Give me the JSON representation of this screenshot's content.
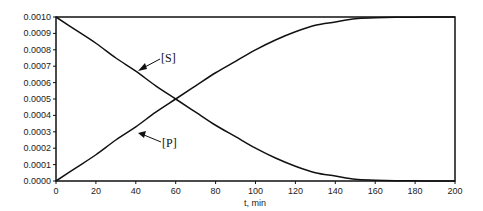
{
  "chart_data": {
    "type": "line",
    "title": "",
    "xlabel": "t, min",
    "ylabel": "",
    "xlim": [
      0,
      200
    ],
    "ylim": [
      0,
      0.001
    ],
    "x_ticks": [
      "0",
      "20",
      "40",
      "60",
      "80",
      "100",
      "120",
      "140",
      "160",
      "180",
      "200"
    ],
    "y_ticks": [
      "0.0000",
      "0.0001",
      "0.0002",
      "0.0003",
      "0.0004",
      "0.0005",
      "0.0006",
      "0.0007",
      "0.0008",
      "0.0009",
      "0.0010"
    ],
    "grid": false,
    "legend": "none (inline annotations with arrows)",
    "x": [
      0,
      10,
      20,
      30,
      40,
      50,
      60,
      70,
      80,
      90,
      100,
      110,
      120,
      130,
      140,
      150,
      160,
      170,
      180,
      190,
      200
    ],
    "series": [
      {
        "name": "[S]",
        "values": [
          0.001,
          0.00092,
          0.00084,
          0.00075,
          0.00067,
          0.00058,
          0.0005,
          0.00042,
          0.00034,
          0.00027,
          0.0002,
          0.00014,
          9e-05,
          5e-05,
          3e-05,
          1e-05,
          5e-06,
          2e-06,
          1e-06,
          0.0,
          0.0
        ]
      },
      {
        "name": "[P]",
        "values": [
          0.0,
          8e-05,
          0.00016,
          0.00025,
          0.00033,
          0.00042,
          0.0005,
          0.00058,
          0.00066,
          0.00073,
          0.0008,
          0.00086,
          0.00091,
          0.00095,
          0.00097,
          0.00099,
          0.000995,
          0.000998,
          0.000999,
          0.001,
          0.001
        ]
      }
    ],
    "annotations": [
      {
        "text": "[S]",
        "points_to": "[S] curve near t≈35"
      },
      {
        "text": "[P]",
        "points_to": "[P] curve near t≈37"
      }
    ]
  }
}
